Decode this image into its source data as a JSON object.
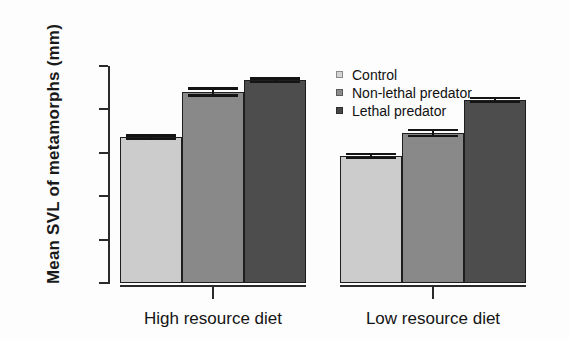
{
  "chart_data": {
    "type": "bar",
    "title": "",
    "xlabel": "",
    "ylabel": "Mean SVL of metamorphs (mm)",
    "ylim": [
      15,
      20
    ],
    "yticks": [
      15,
      16,
      17,
      18,
      19,
      20
    ],
    "ytick_labels": [
      "15",
      "16",
      "17",
      "18",
      "19",
      "20"
    ],
    "grid": false,
    "legend_position": "upper center",
    "categories": [
      "High resource diet",
      "Low resource diet"
    ],
    "series": [
      {
        "name": "Control",
        "color": "#d4d4d4",
        "values": [
          18.36,
          17.93
        ],
        "errors": [
          0.07,
          0.07
        ]
      },
      {
        "name": "Non-lethal predator",
        "color": "#8b8b8b",
        "values": [
          19.4,
          18.46
        ],
        "errors": [
          0.11,
          0.1
        ]
      },
      {
        "name": "Lethal predator",
        "color": "#474747",
        "values": [
          19.67,
          19.22
        ],
        "errors": [
          0.07,
          0.07
        ]
      }
    ]
  },
  "axis": {
    "y_title": "Mean SVL of metamorphs (mm)",
    "ticks": [
      {
        "label": "20",
        "value": 20
      },
      {
        "label": "19",
        "value": 19
      },
      {
        "label": "18",
        "value": 18
      },
      {
        "label": "17",
        "value": 17
      },
      {
        "label": "16",
        "value": 16
      },
      {
        "label": "15",
        "value": 15
      }
    ]
  },
  "groups": [
    {
      "label": "High resource diet"
    },
    {
      "label": "Low resource diet"
    }
  ],
  "legend": {
    "items": [
      {
        "label": "Control",
        "color": "#d4d4d4"
      },
      {
        "label": "Non-lethal predator",
        "color": "#8b8b8b"
      },
      {
        "label": "Lethal predator",
        "color": "#474747"
      }
    ]
  }
}
